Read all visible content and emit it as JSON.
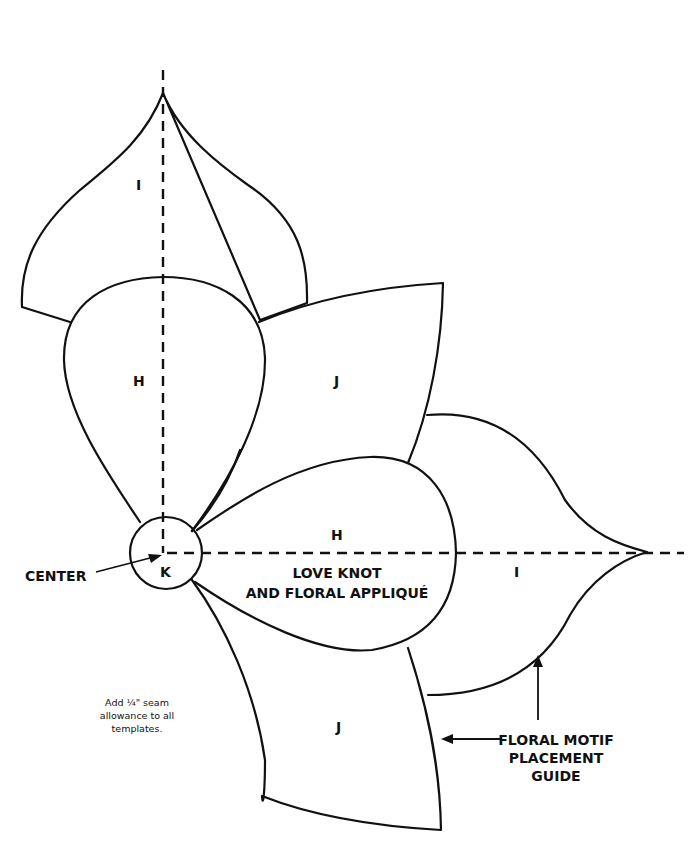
{
  "title": {
    "line1": "LOVE KNOT",
    "line2": "AND FLORAL APPLIQUÉ"
  },
  "pieces": {
    "i_top": "I",
    "i_right": "I",
    "h_top": "H",
    "h_right": "H",
    "j_top": "J",
    "j_bottom": "J",
    "k_center": "K"
  },
  "callouts": {
    "center": "CENTER",
    "guide_line1": "FLORAL MOTIF",
    "guide_line2": "PLACEMENT",
    "guide_line3": "GUIDE"
  },
  "note": {
    "line1": "Add ¼\" seam",
    "line2": "allowance to all",
    "line3": "templates."
  },
  "colors": {
    "line": "#111111",
    "background": "#ffffff"
  }
}
